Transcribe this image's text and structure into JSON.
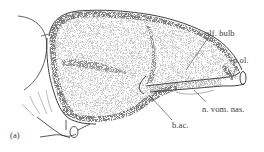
{
  "figure": {
    "panel_label": "(a)",
    "labels": [
      {
        "id": "olf_bulb",
        "text": "olf. bulb"
      },
      {
        "id": "n_ol",
        "text": "n.ol."
      },
      {
        "id": "n_vom_nas",
        "text": "n. vom. nas."
      },
      {
        "id": "b_ac",
        "text": "b.ac."
      }
    ],
    "colors": {
      "ink": "#2b2b2b",
      "stipple": "#555555",
      "background": "#ffffff"
    }
  }
}
